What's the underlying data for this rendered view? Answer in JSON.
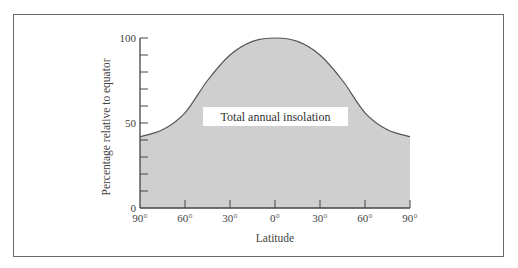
{
  "chart_data": {
    "type": "area",
    "title": "",
    "xlabel": "Latitude",
    "ylabel": "Percentage relative to equator",
    "x_tick_labels": [
      "90°",
      "60°",
      "30°",
      "0°",
      "30°",
      "60°",
      "90°"
    ],
    "y_tick_labels": [
      "0",
      "50",
      "100"
    ],
    "ylim": [
      0,
      100
    ],
    "xlim": [
      -90,
      90
    ],
    "y_minor_tick_step": 10,
    "grid": false,
    "series": [
      {
        "name": "Total annual insolation",
        "x": [
          -90,
          -75,
          -60,
          -45,
          -30,
          -15,
          0,
          15,
          30,
          45,
          60,
          75,
          90
        ],
        "values": [
          42,
          46,
          56,
          75,
          90,
          98,
          100,
          98,
          90,
          75,
          56,
          46,
          42
        ]
      }
    ],
    "annotations": [
      "Total annual insolation"
    ],
    "colors": {
      "fill": "#cfcfcf",
      "line": "#555555",
      "axis": "#444444"
    }
  }
}
